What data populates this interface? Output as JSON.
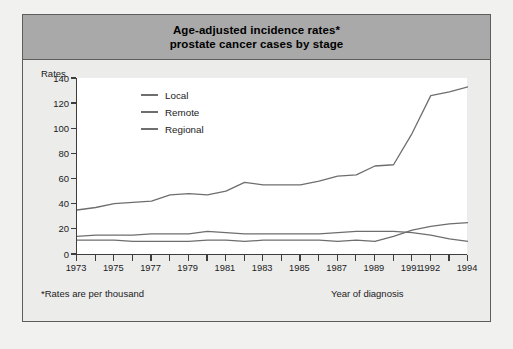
{
  "figure": {
    "title_line1": "Age-adjusted incidence rates*",
    "title_line2": "prostate cancer cases by stage",
    "footnote": "*Rates are per thousand",
    "band_color": "#a9a9a9",
    "line_color": "#6e6e6e",
    "axis_color": "#3d3d3d"
  },
  "chart_data": {
    "type": "line",
    "title": "Age-adjusted incidence rates* prostate cancer cases by stage",
    "xlabel": "Year of diagnosis",
    "ylabel": "Rates",
    "ylim": [
      0,
      140
    ],
    "yticks": [
      0,
      20,
      40,
      60,
      80,
      100,
      120,
      140
    ],
    "xlim": [
      1973,
      1994
    ],
    "grid": false,
    "legend_position": "upper-left-inside",
    "x": [
      1973,
      1974,
      1975,
      1976,
      1977,
      1978,
      1979,
      1980,
      1981,
      1982,
      1983,
      1984,
      1985,
      1986,
      1987,
      1988,
      1989,
      1990,
      1991,
      1992,
      1993,
      1994
    ],
    "xtick_labels": [
      "1973",
      "1975",
      "1977",
      "1979",
      "1981",
      "1983",
      "1985",
      "1987",
      "1989",
      "1991",
      "1992",
      "1994"
    ],
    "xtick_values": [
      1973,
      1975,
      1977,
      1979,
      1981,
      1983,
      1985,
      1987,
      1989,
      1991,
      1992,
      1994
    ],
    "series": [
      {
        "name": "Local",
        "values": [
          35,
          37,
          40,
          41,
          42,
          47,
          48,
          47,
          50,
          57,
          55,
          55,
          55,
          58,
          62,
          63,
          70,
          71,
          96,
          126,
          129,
          133
        ]
      },
      {
        "name": "Remote",
        "values": [
          14,
          15,
          15,
          15,
          16,
          16,
          16,
          18,
          17,
          16,
          16,
          16,
          16,
          16,
          17,
          18,
          18,
          18,
          17,
          15,
          12,
          10
        ]
      },
      {
        "name": "Regional",
        "values": [
          11,
          11,
          11,
          10,
          10,
          10,
          10,
          11,
          11,
          10,
          11,
          11,
          11,
          11,
          10,
          11,
          10,
          14,
          19,
          22,
          24,
          25
        ]
      }
    ]
  }
}
